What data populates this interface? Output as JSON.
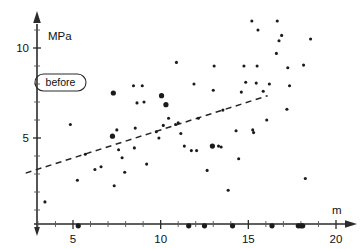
{
  "chart_data": {
    "type": "scatter",
    "title": "",
    "xlabel": "m",
    "ylabel": "MPa",
    "annotation": "before",
    "xlim": [
      2.2,
      20.6
    ],
    "ylim": [
      0,
      11.9
    ],
    "grid": false,
    "legend_position": "none",
    "x_ticks": [
      5,
      10,
      15,
      20
    ],
    "y_ticks": [
      5,
      10
    ],
    "x_tick_labels": [
      "5",
      "10",
      "15",
      "20"
    ],
    "y_tick_labels": [
      "5",
      "10"
    ],
    "x_minor_ticks": [
      3,
      4,
      6,
      7,
      8,
      9,
      11,
      12,
      13,
      14,
      16,
      17,
      18,
      19
    ],
    "y_minor_ticks": [
      1,
      2,
      3,
      4,
      6,
      7,
      8,
      9,
      11
    ],
    "trend_line": {
      "style": "dashed",
      "x_start": 2.3,
      "y_start": 3.05,
      "x_end": 16.1,
      "y_end": 7.35
    },
    "points": [
      {
        "x": 3.4,
        "y": 1.45,
        "size": "small"
      },
      {
        "x": 4.85,
        "y": 5.75,
        "size": "small"
      },
      {
        "x": 5.25,
        "y": 2.65,
        "size": "small"
      },
      {
        "x": 5.3,
        "y": 0.12,
        "size": "large"
      },
      {
        "x": 5.7,
        "y": 4.1,
        "size": "small"
      },
      {
        "x": 6.25,
        "y": 3.25,
        "size": "small"
      },
      {
        "x": 6.6,
        "y": 3.4,
        "size": "small"
      },
      {
        "x": 7.25,
        "y": 5.1,
        "size": "large"
      },
      {
        "x": 7.3,
        "y": 7.5,
        "size": "large"
      },
      {
        "x": 7.35,
        "y": 2.35,
        "size": "small"
      },
      {
        "x": 7.5,
        "y": 5.45,
        "size": "small"
      },
      {
        "x": 7.6,
        "y": 4.35,
        "size": "small"
      },
      {
        "x": 7.8,
        "y": 3.9,
        "size": "small"
      },
      {
        "x": 7.95,
        "y": 3.1,
        "size": "small"
      },
      {
        "x": 8.45,
        "y": 7.9,
        "size": "small"
      },
      {
        "x": 8.5,
        "y": 4.45,
        "size": "small"
      },
      {
        "x": 8.55,
        "y": 5.55,
        "size": "small"
      },
      {
        "x": 8.65,
        "y": 6.95,
        "size": "small"
      },
      {
        "x": 8.95,
        "y": 7.9,
        "size": "small"
      },
      {
        "x": 9.05,
        "y": 7.0,
        "size": "small"
      },
      {
        "x": 9.2,
        "y": 3.55,
        "size": "small"
      },
      {
        "x": 9.75,
        "y": 5.35,
        "size": "small"
      },
      {
        "x": 9.9,
        "y": 5.0,
        "size": "small"
      },
      {
        "x": 10.05,
        "y": 7.35,
        "size": "large"
      },
      {
        "x": 10.15,
        "y": 5.7,
        "size": "small"
      },
      {
        "x": 10.3,
        "y": 6.85,
        "size": "large"
      },
      {
        "x": 10.45,
        "y": 6.1,
        "size": "small"
      },
      {
        "x": 10.85,
        "y": 5.75,
        "size": "small"
      },
      {
        "x": 10.9,
        "y": 9.2,
        "size": "small"
      },
      {
        "x": 11.0,
        "y": 5.85,
        "size": "small"
      },
      {
        "x": 11.15,
        "y": 5.25,
        "size": "small"
      },
      {
        "x": 11.35,
        "y": 4.55,
        "size": "small"
      },
      {
        "x": 11.6,
        "y": 0.12,
        "size": "large"
      },
      {
        "x": 11.75,
        "y": 4.3,
        "size": "small"
      },
      {
        "x": 11.9,
        "y": 8.0,
        "size": "small"
      },
      {
        "x": 12.05,
        "y": 4.3,
        "size": "small"
      },
      {
        "x": 12.15,
        "y": 6.1,
        "size": "small"
      },
      {
        "x": 12.5,
        "y": 0.12,
        "size": "large"
      },
      {
        "x": 12.65,
        "y": 3.2,
        "size": "small"
      },
      {
        "x": 12.95,
        "y": 4.55,
        "size": "large"
      },
      {
        "x": 13.0,
        "y": 7.65,
        "size": "small"
      },
      {
        "x": 13.05,
        "y": 9.0,
        "size": "small"
      },
      {
        "x": 13.3,
        "y": 4.55,
        "size": "small"
      },
      {
        "x": 13.45,
        "y": 4.5,
        "size": "small"
      },
      {
        "x": 13.55,
        "y": 6.55,
        "size": "small"
      },
      {
        "x": 13.85,
        "y": 2.1,
        "size": "small"
      },
      {
        "x": 14.1,
        "y": 0.12,
        "size": "large"
      },
      {
        "x": 14.3,
        "y": 5.4,
        "size": "small"
      },
      {
        "x": 14.45,
        "y": 3.85,
        "size": "small"
      },
      {
        "x": 14.6,
        "y": 7.55,
        "size": "small"
      },
      {
        "x": 14.75,
        "y": 9.0,
        "size": "small"
      },
      {
        "x": 14.85,
        "y": 8.1,
        "size": "small"
      },
      {
        "x": 15.2,
        "y": 11.5,
        "size": "small"
      },
      {
        "x": 15.25,
        "y": 5.45,
        "size": "small"
      },
      {
        "x": 15.3,
        "y": 5.3,
        "size": "small"
      },
      {
        "x": 15.45,
        "y": 8.05,
        "size": "small"
      },
      {
        "x": 15.5,
        "y": 9.0,
        "size": "small"
      },
      {
        "x": 15.55,
        "y": 11.0,
        "size": "small"
      },
      {
        "x": 15.85,
        "y": 7.6,
        "size": "small"
      },
      {
        "x": 16.05,
        "y": 6.0,
        "size": "small"
      },
      {
        "x": 16.2,
        "y": 8.0,
        "size": "small"
      },
      {
        "x": 16.35,
        "y": 0.12,
        "size": "large"
      },
      {
        "x": 16.6,
        "y": 9.7,
        "size": "small"
      },
      {
        "x": 16.65,
        "y": 11.5,
        "size": "small"
      },
      {
        "x": 16.75,
        "y": 10.4,
        "size": "small"
      },
      {
        "x": 16.9,
        "y": 10.7,
        "size": "small"
      },
      {
        "x": 17.2,
        "y": 6.6,
        "size": "small"
      },
      {
        "x": 17.25,
        "y": 8.9,
        "size": "small"
      },
      {
        "x": 17.35,
        "y": 7.9,
        "size": "small"
      },
      {
        "x": 17.85,
        "y": 0.12,
        "size": "large"
      },
      {
        "x": 18.0,
        "y": 0.12,
        "size": "large"
      },
      {
        "x": 18.1,
        "y": 0.12,
        "size": "large"
      },
      {
        "x": 18.15,
        "y": 9.05,
        "size": "small"
      },
      {
        "x": 18.25,
        "y": 2.75,
        "size": "small"
      },
      {
        "x": 18.55,
        "y": 10.5,
        "size": "small"
      }
    ]
  }
}
